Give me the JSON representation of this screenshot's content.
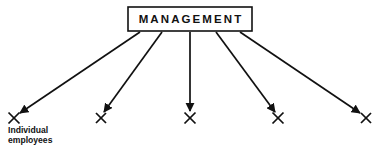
{
  "diagram": {
    "title_node": {
      "label": "MANAGEMENT",
      "box": {
        "x": 128,
        "y": 7,
        "width": 124,
        "height": 24
      }
    },
    "caption": {
      "line1": "Individual",
      "line2": "employees",
      "x": 8,
      "y1": 133,
      "y2": 143
    },
    "endpoints": [
      {
        "name": "employee-1",
        "x": 14,
        "y": 118,
        "size": 5.5
      },
      {
        "name": "employee-2",
        "x": 101,
        "y": 118,
        "size": 5.0
      },
      {
        "name": "employee-3",
        "x": 190,
        "y": 118,
        "size": 5.5
      },
      {
        "name": "employee-4",
        "x": 278,
        "y": 118,
        "size": 5.5
      },
      {
        "name": "employee-5",
        "x": 366,
        "y": 118,
        "size": 5.0
      }
    ],
    "arrows": [
      {
        "name": "arrow-to-employee-1",
        "x1": 140,
        "y1": 32,
        "x2": 20,
        "y2": 113
      },
      {
        "name": "arrow-to-employee-2",
        "x1": 162,
        "y1": 32,
        "x2": 104,
        "y2": 112
      },
      {
        "name": "arrow-to-employee-3",
        "x1": 190,
        "y1": 32,
        "x2": 190,
        "y2": 111
      },
      {
        "name": "arrow-to-employee-4",
        "x1": 216,
        "y1": 32,
        "x2": 275,
        "y2": 112
      },
      {
        "name": "arrow-to-employee-5",
        "x1": 240,
        "y1": 32,
        "x2": 360,
        "y2": 113
      }
    ],
    "colors": {
      "ink": "#111111",
      "background": "#ffffff"
    }
  }
}
